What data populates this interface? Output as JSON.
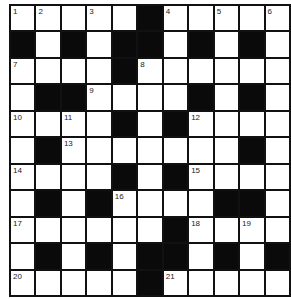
{
  "puzzle": {
    "rows": 11,
    "cols": 11,
    "layout": [
      "WWWWWBWWWWW",
      "BWBWBBWBWBW",
      "WWWWBWWWWWW",
      "WBBWWWWBWBW",
      "WWWWBWBWWWW",
      "WBWWWWWWWBW",
      "WWWWBWBWWWW",
      "WBWBWWWWBBW",
      "WWWWWWBWWWW",
      "WBWBWBBWBWB",
      "WWWWWBWWWWW"
    ],
    "numbers": {
      "0,0": "1",
      "0,1": "2",
      "0,3": "3",
      "0,6": "4",
      "0,8": "5",
      "0,10": "6",
      "2,0": "7",
      "2,5": "8",
      "3,3": "9",
      "4,0": "10",
      "4,2": "11",
      "4,7": "12",
      "5,2": "13",
      "6,0": "14",
      "6,7": "15",
      "7,4": "16",
      "8,0": "17",
      "8,7": "18",
      "8,9": "19",
      "10,0": "20",
      "10,6": "21"
    }
  }
}
